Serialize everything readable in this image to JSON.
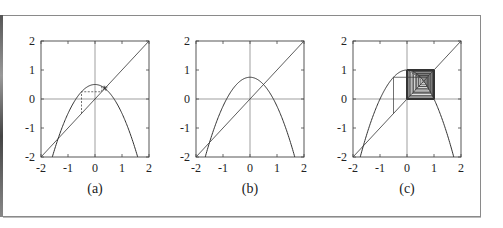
{
  "chart_data": [
    {
      "type": "line",
      "panel": "(a)",
      "title": "",
      "xlabel": "",
      "ylabel": "",
      "xlim": [
        -2,
        2
      ],
      "ylim": [
        -2,
        2
      ],
      "xticks": [
        "-2",
        "-1",
        "0",
        "1",
        "2"
      ],
      "yticks": [
        "-2",
        "-1",
        "0",
        "1",
        "2"
      ],
      "grid": false,
      "series": [
        {
          "name": "f(x) = 0.5 - x^2",
          "function": "parabola",
          "c": 0.5
        },
        {
          "name": "y = x",
          "function": "identity"
        },
        {
          "name": "cobweb",
          "style": "dashed",
          "start": -0.5,
          "behaviour": "converges to fixed point ~0.37"
        }
      ]
    },
    {
      "type": "line",
      "panel": "(b)",
      "title": "",
      "xlabel": "",
      "ylabel": "",
      "xlim": [
        -2,
        2
      ],
      "ylim": [
        -2,
        2
      ],
      "xticks": [
        "-2",
        "-1",
        "0",
        "1",
        "2"
      ],
      "yticks": [
        "-2",
        "-1",
        "0",
        "1",
        "2"
      ],
      "grid": false,
      "series": [
        {
          "name": "f(x) = 0.75 - x^2",
          "function": "parabola",
          "c": 0.75
        },
        {
          "name": "y = x",
          "function": "identity"
        }
      ]
    },
    {
      "type": "line",
      "panel": "(c)",
      "title": "",
      "xlabel": "",
      "ylabel": "",
      "xlim": [
        -2,
        2
      ],
      "ylim": [
        -2,
        2
      ],
      "xticks": [
        "-2",
        "-1",
        "0",
        "1",
        "2"
      ],
      "yticks": [
        "-2",
        "-1",
        "0",
        "1",
        "2"
      ],
      "grid": false,
      "series": [
        {
          "name": "f(x) = 1 - x^2",
          "function": "parabola",
          "c": 1.0
        },
        {
          "name": "y = x",
          "function": "identity"
        },
        {
          "name": "cobweb",
          "style": "solid",
          "start": -0.5,
          "behaviour": "oscillates between 0 and 1"
        }
      ]
    }
  ],
  "panels": [
    {
      "caption": "(a)",
      "c": 0.5,
      "cobweb": true,
      "cobweb_dashed": true
    },
    {
      "caption": "(b)",
      "c": 0.75,
      "cobweb": false,
      "cobweb_dashed": false
    },
    {
      "caption": "(c)",
      "c": 1.0,
      "cobweb": true,
      "cobweb_dashed": false
    }
  ],
  "colors": {
    "curve": "#333333",
    "axes": "#444444",
    "frame": "#8a8a8a"
  }
}
